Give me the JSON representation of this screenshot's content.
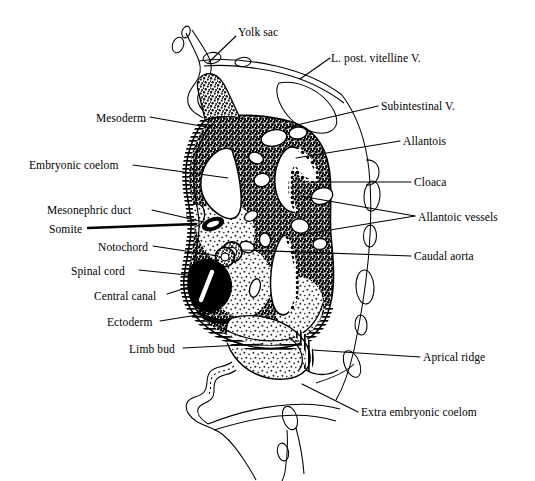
{
  "figure": {
    "ink_color": "#000000",
    "background_color": "#ffffff",
    "width": 535,
    "height": 481
  },
  "labels": {
    "yolk_sac": "Yolk sac",
    "l_post_vitelline_v": "L. post. vitelline V.",
    "subintestinal_v": "Subintestinal V.",
    "allantois": "Allantois",
    "cloaca": "Cloaca",
    "allantoic_vessels": "Allantoic vessels",
    "caudal_aorta": "Caudal aorta",
    "aprical_ridge": "Aprical ridge",
    "extra_embryonic_coelom": "Extra embryonic coelom",
    "mesoderm": "Mesoderm",
    "embryonic_coelom": "Embryonic coelom",
    "mesonephric_duct": "Mesonephric duct",
    "somite": "Somite",
    "notochord": "Notochord",
    "spinal_cord": "Spinal cord",
    "central_canal": "Central canal",
    "ectoderm": "Ectoderm",
    "limb_bud": "Limb bud"
  },
  "label_positions": {
    "yolk_sac": {
      "x": 238,
      "y": 27,
      "align": "left"
    },
    "l_post_vitelline_v": {
      "x": 331,
      "y": 53,
      "align": "left"
    },
    "subintestinal_v": {
      "x": 381,
      "y": 101,
      "align": "left"
    },
    "allantois": {
      "x": 403,
      "y": 136,
      "align": "left"
    },
    "cloaca": {
      "x": 414,
      "y": 177,
      "align": "left"
    },
    "allantoic_vessels": {
      "x": 418,
      "y": 212,
      "align": "left"
    },
    "caudal_aorta": {
      "x": 414,
      "y": 251,
      "align": "left"
    },
    "aprical_ridge": {
      "x": 423,
      "y": 352,
      "align": "left"
    },
    "extra_embryonic_coelom": {
      "x": 361,
      "y": 407,
      "align": "left"
    },
    "mesoderm": {
      "x": 96,
      "y": 113,
      "align": "left"
    },
    "embryonic_coelom": {
      "x": 29,
      "y": 160,
      "align": "left"
    },
    "mesonephric_duct": {
      "x": 47,
      "y": 205,
      "align": "left"
    },
    "somite": {
      "x": 49,
      "y": 224,
      "align": "left"
    },
    "notochord": {
      "x": 98,
      "y": 242,
      "align": "left"
    },
    "spinal_cord": {
      "x": 71,
      "y": 266,
      "align": "left"
    },
    "central_canal": {
      "x": 94,
      "y": 291,
      "align": "left"
    },
    "ectoderm": {
      "x": 107,
      "y": 317,
      "align": "left"
    },
    "limb_bud": {
      "x": 129,
      "y": 344,
      "align": "left"
    }
  },
  "leader_lines": {
    "yolk_sac": "M236,36 L209,62",
    "l_post_vitelline_v": "M330,58 L300,79",
    "subintestinal_v": "M378,106 L284,128",
    "allantois": "M400,141 L296,158",
    "cloaca": "M411,182 L311,182",
    "allantoic_vessels_a": "M415,216 L300,196",
    "allantoic_vessels_b": "M415,216 L300,235",
    "caudal_aorta": "M411,256 L263,238",
    "aprical_ridge": "M420,357 L315,342",
    "extra_embryonic_coelom": "M358,412 L308,386",
    "mesoderm": "M150,117 L205,128",
    "embryonic_coelom": "M133,165 L228,175",
    "mesonephric_duct": "M152,210 L208,222",
    "somite": "M88,228 L200,228",
    "notochord": "M153,246 L231,257",
    "spinal_cord": "M139,270 L206,278",
    "central_canal": "M167,294 L192,285",
    "ectoderm": "M160,321 L232,310",
    "limb_bud": "M183,348 L266,346"
  }
}
